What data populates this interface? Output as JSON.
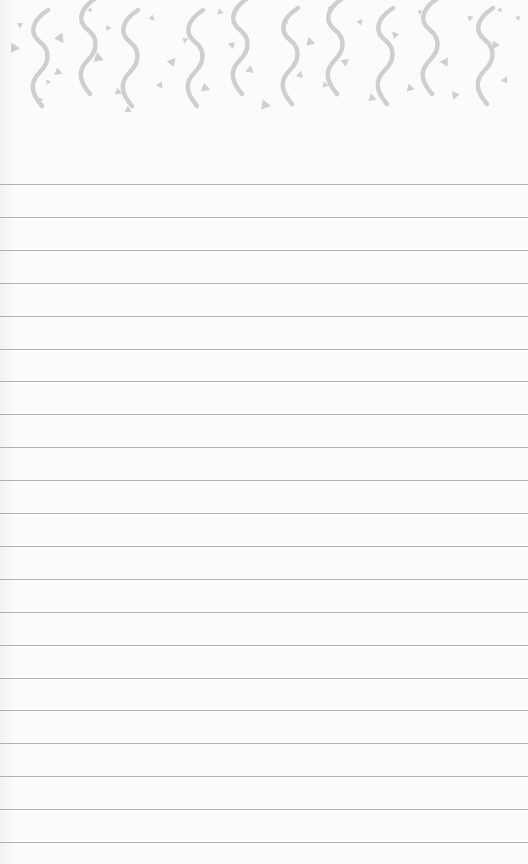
{
  "page": {
    "type": "lined notepad page",
    "background_color": "#fbfbfb",
    "line_color": "#b4b4b4",
    "decoration_color": "#cfcfcf"
  },
  "header": {
    "decoration": "confetti-squiggle-pattern",
    "squiggle_x": [
      40,
      88,
      130,
      195,
      240,
      290,
      335,
      385,
      430,
      485
    ],
    "squiggle_offset": [
      12,
      0,
      12,
      12,
      0,
      10,
      0,
      10,
      0,
      10
    ]
  },
  "lines": {
    "count": 21,
    "first_y": 184,
    "spacing": 32.9
  }
}
